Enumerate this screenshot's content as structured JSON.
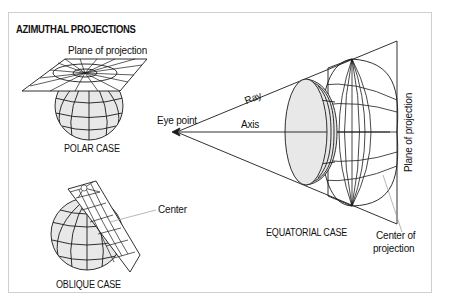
{
  "title": "AZIMUTHAL PROJECTIONS",
  "polar_case": {
    "label": "POLAR CASE",
    "plane_label": "Plane of projection"
  },
  "oblique_case": {
    "label": "OBLIQUE CASE",
    "center_label": "Center"
  },
  "equatorial_case": {
    "label": "EQUATORIAL CASE",
    "eye_point_label": "Eye point",
    "ray_label": "Ray",
    "axis_label": "Axis",
    "plane_label": "Plane of projection",
    "center_label_line1": "Center of",
    "center_label_line2": "projection"
  },
  "colors": {
    "stroke": "#1a1a1a",
    "globe_fill": "#e8e8e8",
    "frame_border": "#cfcfcf",
    "leader_line": "#9a9a9a"
  }
}
